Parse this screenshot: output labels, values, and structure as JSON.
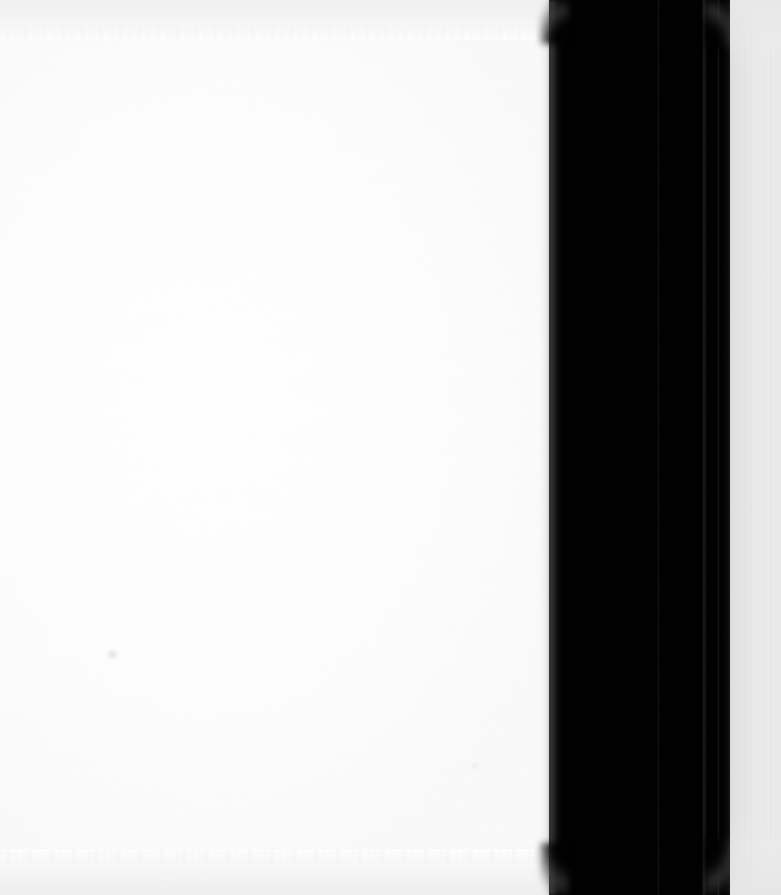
{
  "image": {
    "kind": "scanned-page-photo",
    "width_px": 781,
    "height_px": 895,
    "caption": "Blank scanned page with dark book-gutter shadow band on the right",
    "visible_text": "",
    "has_text_content": false,
    "has_ui_widgets": false
  },
  "regions": {
    "paper": {
      "name": "paper-sheet",
      "description": "Blank white page surface occupying the left portion",
      "x": 0,
      "y": 0,
      "width": 552,
      "height": 895,
      "color": "#ffffff",
      "edge_top_color": "#f1f1f2",
      "edge_bottom_color": "#efeff0"
    },
    "gutter": {
      "name": "gutter-shadow-band",
      "description": "Wide near-black vertical band (book spine / gutter shadow)",
      "x": 549,
      "y": 0,
      "width": 182,
      "height": 895,
      "color": "#010101",
      "seam_color": "#1c1c1e",
      "seam_positions_px": [
        657,
        703,
        717
      ]
    },
    "right_strip": {
      "name": "right-light-strip",
      "description": "Light gray strip at the far right edge of the scan",
      "x": 730,
      "y": 0,
      "width": 51,
      "height": 895,
      "color": "#e9e9e9",
      "color_left": "#dedede",
      "color_right": "#ececec"
    }
  },
  "artifacts": [
    {
      "name": "paper-speck",
      "description": "Faint gray speck / dust smudge on the page",
      "x": 112,
      "y": 655,
      "color": "#cecece"
    },
    {
      "name": "paper-speck-secondary",
      "description": "Second very faint speck lower right of the page",
      "x": 474,
      "y": 766,
      "color": "#e3e3e5"
    }
  ],
  "palette": {
    "paper_white": "#ffffff",
    "paper_offwhite": "#fdfdfd",
    "edge_gray": "#f1f1f2",
    "gutter_black": "#010101",
    "gutter_seam": "#1c1c1e",
    "strip_gray": "#e9e9e9",
    "strip_gray_dark": "#dedede"
  }
}
